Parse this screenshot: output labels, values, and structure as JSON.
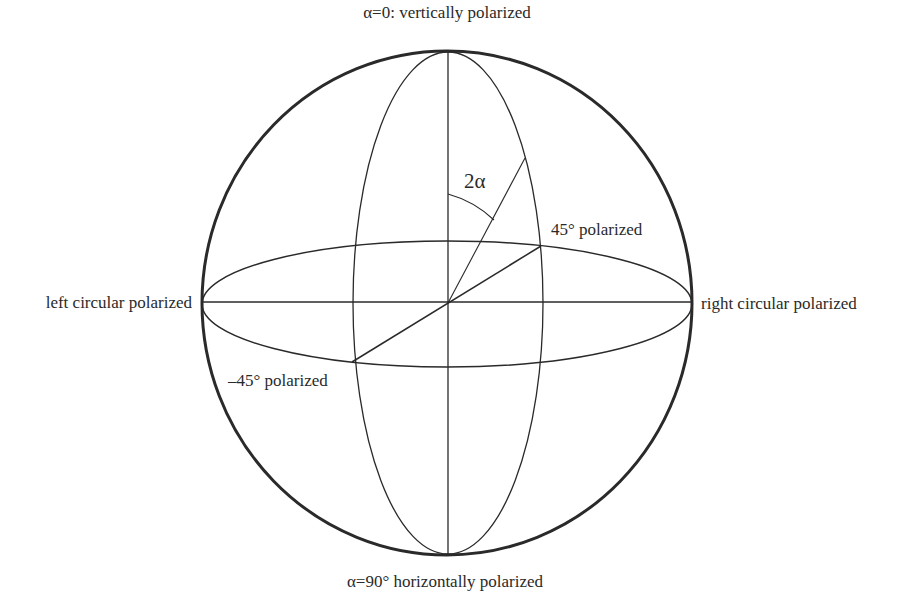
{
  "diagram": {
    "type": "poincare-sphere",
    "labels": {
      "top": "α=0: vertically polarized",
      "bottom": "α=90° horizontally polarized",
      "left": "left circular polarized",
      "right": "right circular polarized",
      "plus45": "45° polarized",
      "minus45": "–45° polarized",
      "angle": "2α"
    },
    "colors": {
      "stroke": "#2a2a2a",
      "background": "#ffffff"
    }
  }
}
